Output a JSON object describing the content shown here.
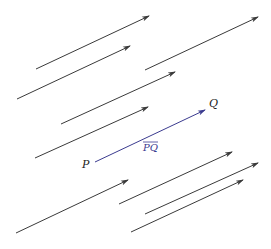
{
  "diagram": {
    "colors": {
      "background": "#ffffff",
      "arrow": "#3a3a3a",
      "highlight": "#3b3b8f",
      "label": "#222222"
    },
    "arrows": [
      {
        "id": "a1",
        "x1": 36,
        "y1": 69,
        "x2": 149,
        "y2": 16
      },
      {
        "id": "a2",
        "x1": 17,
        "y1": 99,
        "x2": 130,
        "y2": 46
      },
      {
        "id": "a3",
        "x1": 145,
        "y1": 70,
        "x2": 258,
        "y2": 17
      },
      {
        "id": "a4",
        "x1": 61,
        "y1": 124,
        "x2": 175,
        "y2": 72
      },
      {
        "id": "a5",
        "x1": 35,
        "y1": 158,
        "x2": 148,
        "y2": 107
      },
      {
        "id": "a6",
        "x1": 16,
        "y1": 233,
        "x2": 128,
        "y2": 180
      },
      {
        "id": "a7",
        "x1": 119,
        "y1": 204,
        "x2": 232,
        "y2": 152
      },
      {
        "id": "a8",
        "x1": 145,
        "y1": 214,
        "x2": 258,
        "y2": 163
      },
      {
        "id": "a9",
        "x1": 131,
        "y1": 232,
        "x2": 243,
        "y2": 180
      }
    ],
    "highlight_vector": {
      "x1": 95,
      "y1": 162,
      "x2": 205,
      "y2": 110,
      "start_label": "P",
      "end_label": "Q",
      "name_label": "PQ"
    }
  }
}
